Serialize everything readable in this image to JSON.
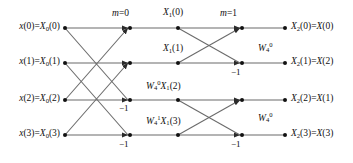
{
  "diagram": {
    "type": "fft-butterfly-signal-flow-graph",
    "stages": [
      {
        "name": "stage-0",
        "label": "m=0",
        "x": 125,
        "y": 12
      },
      {
        "name": "stage-1",
        "label": "m=1",
        "x": 233,
        "y": 12
      }
    ],
    "inputs": [
      {
        "id": "in0",
        "label_plain": "x(0)=X0(0)",
        "row": 0
      },
      {
        "id": "in1",
        "label_plain": "x(1)=X0(1)",
        "row": 1
      },
      {
        "id": "in2",
        "label_plain": "x(2)=X0(2)",
        "row": 2
      },
      {
        "id": "in3",
        "label_plain": "x(3)=X0(3)",
        "row": 3
      }
    ],
    "outputs": [
      {
        "id": "out0",
        "label_plain": "X2(0)=X(0)",
        "row": 0
      },
      {
        "id": "out1",
        "label_plain": "X2(1)=X(2)",
        "row": 1
      },
      {
        "id": "out2",
        "label_plain": "X2(2)=X(1)",
        "row": 2
      },
      {
        "id": "out3",
        "label_plain": "X2(3)=X(3)",
        "row": 3
      }
    ],
    "intermediate_labels": [
      {
        "id": "mid0",
        "label_plain": "X1(0)",
        "row": 0,
        "x": 178,
        "y": 12
      },
      {
        "id": "mid1",
        "label_plain": "X1(1)",
        "row": 1,
        "x": 178,
        "y": 47
      },
      {
        "id": "mid2",
        "label_plain": "W4^0 X1(2)",
        "row": 2,
        "x": 178,
        "y": 84
      },
      {
        "id": "mid3",
        "label_plain": "W4^1 X1(3)",
        "row": 3,
        "x": 178,
        "y": 118
      }
    ],
    "twiddle_labels": [
      {
        "id": "tw-stage2-row1",
        "label_plain": "W4^0",
        "x": 263,
        "y": 44
      },
      {
        "id": "tw-stage2-row3",
        "label_plain": "W4^0",
        "x": 263,
        "y": 114
      }
    ],
    "minus_one_labels": [
      {
        "id": "m1-s1-r2",
        "label": "−1",
        "x": 122,
        "y": 103
      },
      {
        "id": "m1-s1-r3",
        "label": "−1",
        "x": 122,
        "y": 139
      },
      {
        "id": "m1-s2-r1",
        "label": "−1",
        "x": 234,
        "y": 67
      },
      {
        "id": "m1-s2-r3",
        "label": "−1",
        "x": 234,
        "y": 139
      }
    ],
    "rows_y": [
      28,
      63,
      100,
      135
    ],
    "node_columns_x": [
      65,
      128,
      178,
      240,
      285
    ],
    "colors": {
      "line": "#5a5a5a",
      "node": "#111111",
      "text": "#111111",
      "background": "#ffffff"
    }
  }
}
